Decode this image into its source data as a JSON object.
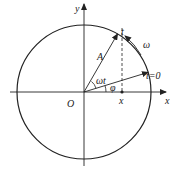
{
  "diagram": {
    "type": "rotating-vector (phasor) circle",
    "labels": {
      "y_axis": "y",
      "x_axis": "x",
      "origin": "O",
      "amplitude": "A",
      "time_point": "t",
      "angular_velocity": "ω",
      "initial_time": "t=0",
      "omega_t": "ωt",
      "phase": "φ",
      "projection": "x"
    },
    "geometry": {
      "center": [
        84,
        92
      ],
      "radius": 67,
      "initial_phase_deg": 17,
      "current_angle_deg": 60
    },
    "colors": {
      "stroke": "#222222",
      "background": "#ffffff"
    }
  }
}
